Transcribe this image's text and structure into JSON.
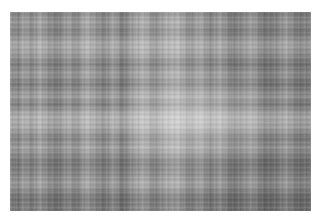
{
  "image": {
    "description": "Grayscale plaid / woven texture pattern with horizontal and vertical stripes",
    "colors": {
      "background": "#ffffff",
      "base_gray": "#9a9a9a",
      "light_stripe": "#e6e6e6",
      "dark_stripe": "#5a5a5a"
    }
  }
}
